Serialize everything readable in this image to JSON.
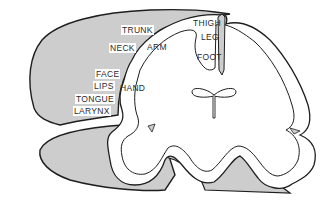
{
  "figure": {
    "colors": {
      "shaded": "#cdcdcd",
      "outline": "#1e1e1e",
      "cortex_white": "#ffffff",
      "background": "#ffffff"
    },
    "labels": [
      {
        "id": "trunk",
        "text": "TRUNK",
        "x": 121,
        "y": 25
      },
      {
        "id": "neck",
        "text": "NECK",
        "x": 109,
        "y": 43
      },
      {
        "id": "arm",
        "text": "ARM",
        "x": 146,
        "y": 43
      },
      {
        "id": "thigh",
        "text": "THIGH",
        "x": 192,
        "y": 18
      },
      {
        "id": "leg",
        "text": "LEG",
        "x": 199,
        "y": 33
      },
      {
        "id": "foot",
        "text": "FOOT",
        "x": 196,
        "y": 52
      },
      {
        "id": "face",
        "text": "FACE",
        "x": 95,
        "y": 69
      },
      {
        "id": "lips",
        "text": "LIPS",
        "x": 93,
        "y": 81
      },
      {
        "id": "hand",
        "text": "HAND",
        "x": 119,
        "y": 83
      },
      {
        "id": "tongue",
        "text": "TONGUE",
        "x": 75,
        "y": 94
      },
      {
        "id": "larynx",
        "text": "LARYNX",
        "x": 73,
        "y": 106
      }
    ]
  }
}
